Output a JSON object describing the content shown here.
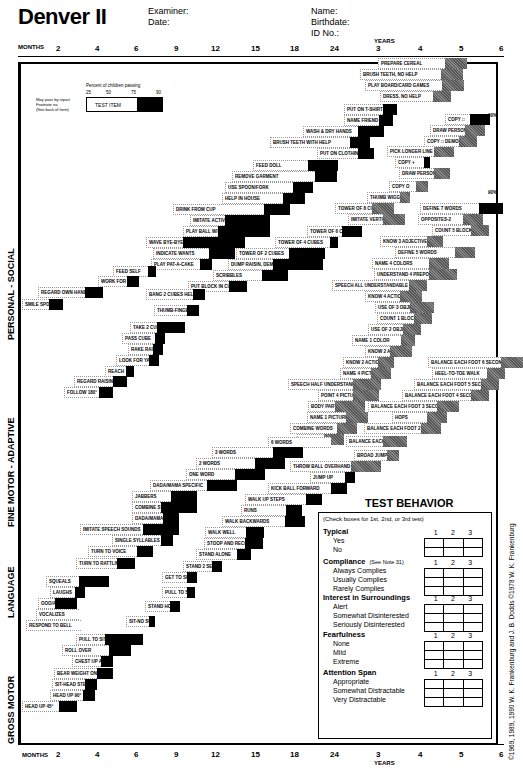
{
  "header": {
    "title": "Denver II",
    "examiner_label": "Examiner:",
    "date_label": "Date:",
    "name_label": "Name:",
    "birthdate_label": "Birthdate:",
    "id_label": "ID No.:"
  },
  "axis": {
    "months_label": "MONTHS",
    "years_label": "YEARS",
    "ticks": [
      "2",
      "4",
      "6",
      "9",
      "12",
      "15",
      "18",
      "24",
      "3",
      "4",
      "5",
      "6"
    ]
  },
  "legend": {
    "title": "Percent of children passing",
    "percents": [
      "25",
      "50",
      "75",
      "90"
    ],
    "test_item": "TEST ITEM",
    "may_pass": "May pass by report",
    "footnote": "Footnote no.",
    "see_back": "(See back of form)"
  },
  "sectors": {
    "personal_social": "PERSONAL - SOCIAL",
    "fine_motor": "FINE MOTOR - ADAPTIVE",
    "language": "LANGUAGE",
    "gross_motor": "GROSS MOTOR"
  },
  "items": [
    {
      "label": "PREPARE CEREAL",
      "x": 378,
      "y": 58,
      "w": 62,
      "b": 22,
      "grey": true
    },
    {
      "label": "BRUSH TEETH, NO HELP",
      "x": 360,
      "y": 69,
      "w": 76,
      "b": 22,
      "grey": true
    },
    {
      "label": "PLAY BOARD/CARD GAMES",
      "x": 365,
      "y": 80,
      "w": 72,
      "b": 22,
      "grey": true
    },
    {
      "label": "DRESS, NO HELP",
      "x": 380,
      "y": 91,
      "w": 48,
      "b": 18,
      "grey": true
    },
    {
      "label": "PUT ON T-SHIRT",
      "x": 344,
      "y": 104,
      "w": 34,
      "b": 14,
      "grey": false
    },
    {
      "label": "NAME FRIEND",
      "x": 344,
      "y": 115,
      "w": 30,
      "b": 14,
      "grey": false
    },
    {
      "label": "WASH & DRY HANDS",
      "x": 303,
      "y": 126,
      "w": 50,
      "b": 26,
      "grey": false
    },
    {
      "label": "BRUSH TEETH WITH HELP",
      "x": 270,
      "y": 137,
      "w": 75,
      "b": 20,
      "grey": false
    },
    {
      "label": "PUT ON CLOTHING",
      "x": 317,
      "y": 148,
      "w": 36,
      "b": 16,
      "grey": false
    },
    {
      "label": "FEED DOLL",
      "x": 253,
      "y": 160,
      "w": 50,
      "b": 30,
      "grey": false
    },
    {
      "label": "REMOVE GARMENT",
      "x": 232,
      "y": 171,
      "w": 78,
      "b": 22,
      "grey": false
    },
    {
      "label": "USE SPOON/FORK",
      "x": 225,
      "y": 182,
      "w": 63,
      "b": 20,
      "grey": false
    },
    {
      "label": "HELP IN HOUSE",
      "x": 222,
      "y": 193,
      "w": 56,
      "b": 22,
      "grey": false
    },
    {
      "label": "DRINK FROM CUP",
      "x": 173,
      "y": 204,
      "w": 86,
      "b": 26,
      "grey": false
    },
    {
      "label": "IMITATE ACTIVITIES",
      "x": 190,
      "y": 215,
      "w": 30,
      "b": 45,
      "grey": false
    },
    {
      "label": "PLAY BALL WITH EXAMINER",
      "x": 183,
      "y": 226,
      "w": 30,
      "b": 52,
      "grey": false
    },
    {
      "label": "WAVE BYE-BYE",
      "x": 146,
      "y": 237,
      "w": 32,
      "b": 62,
      "grey": false
    },
    {
      "label": "INDICATE WANTS",
      "x": 153,
      "y": 248,
      "w": 51,
      "b": 26,
      "grey": false
    },
    {
      "label": "PLAY PAT-A-CAKE",
      "x": 151,
      "y": 259,
      "w": 44,
      "b": 12,
      "grey": false
    },
    {
      "label": "TOWER OF 2 CUBES",
      "x": 236,
      "y": 248,
      "w": 48,
      "b": 36,
      "grey": false
    },
    {
      "label": "DUMP RAISIN, DEMONSTRATED",
      "x": 228,
      "y": 259,
      "w": 40,
      "b": 50,
      "grey": false
    },
    {
      "label": "SCRIBBLES",
      "x": 213,
      "y": 270,
      "w": 44,
      "b": 26,
      "grey": false
    },
    {
      "label": "PUT BLOCK IN CUP",
      "x": 188,
      "y": 281,
      "w": 36,
      "b": 18,
      "grey": false
    },
    {
      "label": "TOWER OF 4 CUBES",
      "x": 275,
      "y": 237,
      "w": 50,
      "b": 8,
      "grey": false
    },
    {
      "label": "TOWER OF 6 CUBES",
      "x": 307,
      "y": 226,
      "w": 30,
      "b": 20,
      "grey": false
    },
    {
      "label": "TOWER OF 8 CUBES",
      "x": 335,
      "y": 203,
      "w": 32,
      "b": 22,
      "grey": true
    },
    {
      "label": "IMITATE VERTICAL LINE",
      "x": 348,
      "y": 214,
      "w": 30,
      "b": 22,
      "grey": true
    },
    {
      "label": "THUMB WIGGLE",
      "x": 367,
      "y": 192,
      "w": 28,
      "b": 10,
      "grey": true
    },
    {
      "label": "COPY O",
      "x": 389,
      "y": 181,
      "w": 22,
      "b": 12,
      "grey": true
    },
    {
      "label": "DRAW PERSON 3 PARTS",
      "x": 399,
      "y": 168,
      "w": 30,
      "b": 16,
      "grey": true
    },
    {
      "label": "COPY +",
      "x": 395,
      "y": 157,
      "w": 24,
      "b": 6,
      "grey": false
    },
    {
      "label": "PICK LONGER LINE",
      "x": 387,
      "y": 146,
      "w": 42,
      "b": 20,
      "grey": true
    },
    {
      "label": "COPY □ DEMONSTRATED",
      "x": 424,
      "y": 136,
      "w": 30,
      "b": 18,
      "grey": true
    },
    {
      "label": "DRAW PERSON 6 PARTS",
      "x": 430,
      "y": 125,
      "w": 30,
      "b": 20,
      "grey": true
    },
    {
      "label": "COPY □",
      "x": 445,
      "y": 114,
      "w": 20,
      "b": 20,
      "grey": false
    },
    {
      "label": "DEFINE 7 WORDS",
      "x": 420,
      "y": 203,
      "w": 54,
      "b": 24,
      "grey": false
    },
    {
      "label": "OPPOSITES-2",
      "x": 418,
      "y": 214,
      "w": 40,
      "b": 20,
      "grey": true
    },
    {
      "label": "COUNT 5 BLOCKS",
      "x": 432,
      "y": 225,
      "w": 34,
      "b": 18,
      "grey": true
    },
    {
      "label": "KNOW 3 ADJECTIVES",
      "x": 380,
      "y": 236,
      "w": 42,
      "b": 16,
      "grey": true
    },
    {
      "label": "DEFINE 5 WORDS",
      "x": 395,
      "y": 247,
      "w": 55,
      "b": 20,
      "grey": true
    },
    {
      "label": "NAME 4 COLORS",
      "x": 372,
      "y": 258,
      "w": 52,
      "b": 20,
      "grey": true
    },
    {
      "label": "UNDERSTAND 4 PREPOSITIONS",
      "x": 374,
      "y": 269,
      "w": 50,
      "b": 28,
      "grey": true
    },
    {
      "label": "SPEECH ALL UNDERSTANDABLE",
      "x": 332,
      "y": 280,
      "w": 72,
      "b": 18,
      "grey": true
    },
    {
      "label": "KNOW 4 ACTIONS",
      "x": 365,
      "y": 291,
      "w": 30,
      "b": 22,
      "grey": true
    },
    {
      "label": "USE OF 3 OBJECTS",
      "x": 375,
      "y": 302,
      "w": 30,
      "b": 24,
      "grey": true
    },
    {
      "label": "COUNT 1 BLOCK",
      "x": 377,
      "y": 313,
      "w": 32,
      "b": 18,
      "grey": true
    },
    {
      "label": "USE OF 2 OBJECTS",
      "x": 368,
      "y": 324,
      "w": 30,
      "b": 18,
      "grey": true
    },
    {
      "label": "NAME 1 COLOR",
      "x": 352,
      "y": 335,
      "w": 44,
      "b": 14,
      "grey": true
    },
    {
      "label": "KNOW 2 ADJECTIVES",
      "x": 365,
      "y": 346,
      "w": 20,
      "b": 22,
      "grey": true
    },
    {
      "label": "KNOW 2 ACTIONS",
      "x": 343,
      "y": 357,
      "w": 30,
      "b": 16,
      "grey": true
    },
    {
      "label": "NAME 4 PICTURES",
      "x": 340,
      "y": 368,
      "w": 26,
      "b": 20,
      "grey": true
    },
    {
      "label": "SPEECH HALF UNDERSTANDABLE",
      "x": 288,
      "y": 379,
      "w": 60,
      "b": 28,
      "grey": true
    },
    {
      "label": "POINT 4 PICTURES",
      "x": 318,
      "y": 390,
      "w": 30,
      "b": 26,
      "grey": true
    },
    {
      "label": "BODY PARTS",
      "x": 308,
      "y": 401,
      "w": 22,
      "b": 30,
      "grey": true
    },
    {
      "label": "NAME 1 PICTURE",
      "x": 307,
      "y": 412,
      "w": 34,
      "b": 22,
      "grey": true
    },
    {
      "label": "COMBINE WORDS",
      "x": 290,
      "y": 423,
      "w": 42,
      "b": 20,
      "grey": true
    },
    {
      "label": "POINT 2 PICTURES",
      "x": 297,
      "y": 434,
      "w": 22,
      "b": 20,
      "grey": true
    },
    {
      "label": "BALANCE EACH FOOT 6 SECONDS",
      "x": 428,
      "y": 357,
      "w": 68,
      "b": 22,
      "grey": true
    },
    {
      "label": "HEEL-TO-TOE WALK",
      "x": 432,
      "y": 368,
      "w": 50,
      "b": 18,
      "grey": true
    },
    {
      "label": "BALANCE EACH FOOT 5 SECONDS",
      "x": 414,
      "y": 379,
      "w": 62,
      "b": 18,
      "grey": true
    },
    {
      "label": "BALANCE EACH FOOT 4 SECONDS",
      "x": 402,
      "y": 390,
      "w": 64,
      "b": 18,
      "grey": true
    },
    {
      "label": "BALANCE EACH FOOT 3 SECONDS",
      "x": 368,
      "y": 401,
      "w": 64,
      "b": 22,
      "grey": true
    },
    {
      "label": "HOPS",
      "x": 392,
      "y": 412,
      "w": 30,
      "b": 20,
      "grey": true
    },
    {
      "label": "BALANCE EACH FOOT 2 SECONDS",
      "x": 364,
      "y": 423,
      "w": 52,
      "b": 20,
      "grey": true
    },
    {
      "label": "BALANCE EACH FOOT 1 SECOND",
      "x": 346,
      "y": 436,
      "w": 32,
      "b": 24,
      "grey": true
    },
    {
      "label": "BROAD JUMP",
      "x": 354,
      "y": 450,
      "w": 28,
      "b": 12,
      "grey": true
    },
    {
      "label": "THROW BALL OVERHAND",
      "x": 290,
      "y": 461,
      "w": 56,
      "b": 30,
      "grey": true
    },
    {
      "label": "JUMP UP",
      "x": 310,
      "y": 472,
      "w": 30,
      "b": 10,
      "grey": false
    },
    {
      "label": "6 WORDS",
      "x": 268,
      "y": 437,
      "w": 58,
      "b": 0,
      "grey": false
    },
    {
      "label": "3 WORDS",
      "x": 212,
      "y": 447,
      "w": 56,
      "b": 30,
      "grey": false
    },
    {
      "label": "2 WORDS",
      "x": 196,
      "y": 458,
      "w": 54,
      "b": 30,
      "grey": false
    },
    {
      "label": "ONE WORD",
      "x": 186,
      "y": 469,
      "w": 44,
      "b": 30,
      "grey": false
    },
    {
      "label": "DADA/MAMA SPECIFIC",
      "x": 150,
      "y": 480,
      "w": 52,
      "b": 30,
      "grey": false
    },
    {
      "label": "KICK BALL FORWARD",
      "x": 268,
      "y": 483,
      "w": 58,
      "b": 16,
      "grey": false
    },
    {
      "label": "WALK UP STEPS",
      "x": 245,
      "y": 494,
      "w": 56,
      "b": 16,
      "grey": false
    },
    {
      "label": "RUNS",
      "x": 241,
      "y": 505,
      "w": 40,
      "b": 16,
      "grey": false
    },
    {
      "label": "JABBERS",
      "x": 132,
      "y": 491,
      "w": 34,
      "b": 26,
      "grey": false
    },
    {
      "label": "COMBINE SYLLABLES",
      "x": 132,
      "y": 502,
      "w": 24,
      "b": 36,
      "grey": false
    },
    {
      "label": "DADA/MAMA NON-SPECIFIC",
      "x": 132,
      "y": 513,
      "w": 26,
      "b": 16,
      "grey": false
    },
    {
      "label": "IMITATE SPEECH SOUNDS",
      "x": 80,
      "y": 524,
      "w": 58,
      "b": 36,
      "grey": false
    },
    {
      "label": "SINGLE SYLLABLES",
      "x": 112,
      "y": 535,
      "w": 44,
      "b": 12,
      "grey": false
    },
    {
      "label": "TURN TO VOICE",
      "x": 88,
      "y": 546,
      "w": 44,
      "b": 16,
      "grey": false
    },
    {
      "label": "TURN TO RATTLING SOUND",
      "x": 76,
      "y": 558,
      "w": 36,
      "b": 18,
      "grey": false
    },
    {
      "label": "WALK BACKWARDS",
      "x": 222,
      "y": 516,
      "w": 58,
      "b": 20,
      "grey": false
    },
    {
      "label": "WALK WELL",
      "x": 205,
      "y": 527,
      "w": 36,
      "b": 18,
      "grey": false
    },
    {
      "label": "STOOP AND RECOVER",
      "x": 204,
      "y": 538,
      "w": 36,
      "b": 18,
      "grey": false
    },
    {
      "label": "STAND ALONE",
      "x": 196,
      "y": 549,
      "w": 36,
      "b": 14,
      "grey": false
    },
    {
      "label": "STAND 2 SECONDS",
      "x": 183,
      "y": 561,
      "w": 24,
      "b": 10,
      "grey": false
    },
    {
      "label": "GET TO SITTING",
      "x": 162,
      "y": 572,
      "w": 20,
      "b": 10,
      "grey": false
    },
    {
      "label": "PULL TO STAND",
      "x": 162,
      "y": 587,
      "w": 20,
      "b": 8,
      "grey": false
    },
    {
      "label": "STAND HOLDING ON",
      "x": 145,
      "y": 601,
      "w": 20,
      "b": 10,
      "grey": false
    },
    {
      "label": "SIT-NO SUPPORT",
      "x": 126,
      "y": 616,
      "w": 18,
      "b": 6,
      "grey": false
    },
    {
      "label": "SQUEALS",
      "x": 46,
      "y": 576,
      "w": 28,
      "b": 30,
      "grey": false
    },
    {
      "label": "LAUGHS",
      "x": 50,
      "y": 587,
      "w": 20,
      "b": 10,
      "grey": false
    },
    {
      "label": "OOO/AAH",
      "x": 38,
      "y": 598,
      "w": 12,
      "b": 22,
      "grey": false
    },
    {
      "label": "VOCALIZES",
      "x": 36,
      "y": 609,
      "w": 38,
      "b": 0,
      "grey": false
    },
    {
      "label": "RESPOND TO BELL",
      "x": 26,
      "y": 620,
      "w": 50,
      "b": 0,
      "grey": false
    },
    {
      "label": "PULL TO SIT, NO HEAD LAG",
      "x": 76,
      "y": 634,
      "w": 24,
      "b": 38,
      "grey": false
    },
    {
      "label": "ROLL OVER",
      "x": 62,
      "y": 645,
      "w": 42,
      "b": 22,
      "grey": false
    },
    {
      "label": "CHEST UP ARM SUPPORT",
      "x": 72,
      "y": 656,
      "w": 24,
      "b": 12,
      "grey": false
    },
    {
      "label": "BEAR WEIGHT ON LEGS",
      "x": 54,
      "y": 668,
      "w": 38,
      "b": 16,
      "grey": false
    },
    {
      "label": "SIT-HEAD STEADY",
      "x": 52,
      "y": 679,
      "w": 28,
      "b": 12,
      "grey": false
    },
    {
      "label": "HEAD UP 90°",
      "x": 50,
      "y": 690,
      "w": 28,
      "b": 12,
      "grey": false
    },
    {
      "label": "HEAD UP 45°",
      "x": 22,
      "y": 701,
      "w": 32,
      "b": 18,
      "grey": false
    },
    {
      "label": "FEED SELF",
      "x": 113,
      "y": 266,
      "w": 30,
      "b": 8,
      "grey": false
    },
    {
      "label": "WORK FOR TOY",
      "x": 98,
      "y": 276,
      "w": 24,
      "b": 12,
      "grey": false
    },
    {
      "label": "REGARD OWN HAND",
      "x": 38,
      "y": 287,
      "w": 42,
      "b": 18,
      "grey": false
    },
    {
      "label": "SMILE SPONTANEOUSLY",
      "x": 22,
      "y": 299,
      "w": 22,
      "b": 14,
      "grey": false
    },
    {
      "label": "TAKE 2 CUBES",
      "x": 130,
      "y": 322,
      "w": 22,
      "b": 28,
      "grey": false
    },
    {
      "label": "PASS CUBE",
      "x": 122,
      "y": 333,
      "w": 28,
      "b": 10,
      "grey": false
    },
    {
      "label": "RAKE RAISIN",
      "x": 128,
      "y": 344,
      "w": 20,
      "b": 10,
      "grey": false
    },
    {
      "label": "LOOK FOR YARN",
      "x": 116,
      "y": 355,
      "w": 28,
      "b": 10,
      "grey": false
    },
    {
      "label": "REACH",
      "x": 105,
      "y": 366,
      "w": 16,
      "b": 8,
      "grey": false
    },
    {
      "label": "REGARD RAISIN",
      "x": 74,
      "y": 376,
      "w": 34,
      "b": 14,
      "grey": false
    },
    {
      "label": "FOLLOW 180°",
      "x": 64,
      "y": 387,
      "w": 30,
      "b": 14,
      "grey": false
    },
    {
      "label": "BANG 2 CUBES HELD IN HANDS",
      "x": 146,
      "y": 289,
      "w": 42,
      "b": 12,
      "grey": false
    },
    {
      "label": "THUMB-FINGER GRASP",
      "x": 154,
      "y": 305,
      "w": 28,
      "b": 12,
      "grey": false
    }
  ],
  "test_behavior": {
    "title": "TEST BEHAVIOR",
    "note": "(Check boxes for 1st, 2nd, or 3rd test)",
    "columns": [
      "1",
      "2",
      "3"
    ],
    "groups": [
      {
        "heading": "Typical",
        "sub": "",
        "options": [
          "Yes",
          "No"
        ]
      },
      {
        "heading": "Compliance",
        "sub": "(See Note 31)",
        "options": [
          "Always Complies",
          "Usually Complies",
          "Rarely Complies"
        ]
      },
      {
        "heading": "Interest in Surroundings",
        "sub": "",
        "options": [
          "Alert",
          "Somewhat Disinterested",
          "Seriously Disinterested"
        ]
      },
      {
        "heading": "Fearfulness",
        "sub": "",
        "options": [
          "None",
          "Mild",
          "Extreme"
        ]
      },
      {
        "heading": "Attention Span",
        "sub": "",
        "options": [
          "Appropriate",
          "Somewhat Distractable",
          "Very Distractable"
        ]
      }
    ]
  },
  "copyright": "©1969, 1989, 1990 W. K. Frankenburg and J. B. Dodds  ©1978 W. K. Frankenburg",
  "pct90_marker": "90%"
}
